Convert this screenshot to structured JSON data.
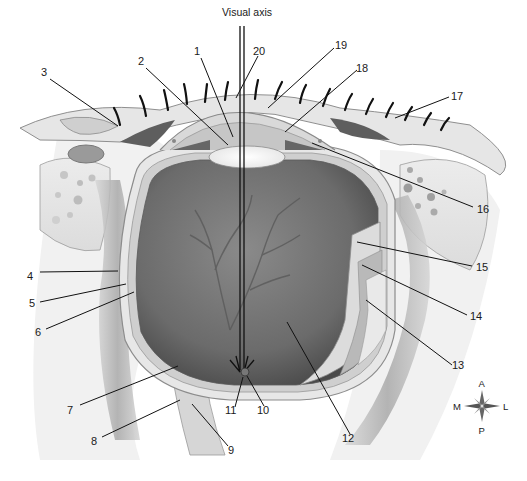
{
  "figure": {
    "visual_axis_label": "Visual axis",
    "labels": [
      {
        "n": "1",
        "x": 198,
        "y": 54
      },
      {
        "n": "2",
        "x": 142,
        "y": 64
      },
      {
        "n": "3",
        "x": 44,
        "y": 75
      },
      {
        "n": "4",
        "x": 29,
        "y": 276
      },
      {
        "n": "5",
        "x": 31,
        "y": 303
      },
      {
        "n": "6",
        "x": 37,
        "y": 331
      },
      {
        "n": "7",
        "x": 69,
        "y": 410
      },
      {
        "n": "8",
        "x": 93,
        "y": 441
      },
      {
        "n": "9",
        "x": 231,
        "y": 451
      },
      {
        "n": "10",
        "x": 263,
        "y": 413
      },
      {
        "n": "11",
        "x": 229,
        "y": 413
      },
      {
        "n": "12",
        "x": 347,
        "y": 440
      },
      {
        "n": "13",
        "x": 457,
        "y": 368
      },
      {
        "n": "14",
        "x": 473,
        "y": 319
      },
      {
        "n": "15",
        "x": 478,
        "y": 270
      },
      {
        "n": "16",
        "x": 478,
        "y": 212
      },
      {
        "n": "17",
        "x": 455,
        "y": 101
      },
      {
        "n": "18",
        "x": 360,
        "y": 72
      },
      {
        "n": "19",
        "x": 337,
        "y": 48
      },
      {
        "n": "20",
        "x": 255,
        "y": 54
      }
    ],
    "compass": {
      "top": "A",
      "bottom": "P",
      "left": "M",
      "right": "L"
    }
  }
}
